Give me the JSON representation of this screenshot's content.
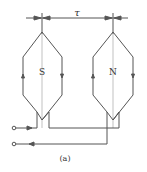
{
  "diagram": {
    "pole_pitch_label": "τ",
    "left_coil": {
      "pole_label": "S"
    },
    "right_coil": {
      "pole_label": "N"
    },
    "caption": "(a)",
    "colors": {
      "line": "#555555",
      "text": "#333333"
    }
  }
}
